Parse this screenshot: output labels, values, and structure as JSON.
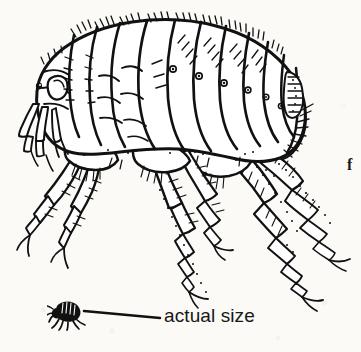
{
  "figure": {
    "caption_letter": "f",
    "background_color": "#fbfaf7",
    "ink_color": "#111111"
  },
  "scale_indicator": {
    "label": "actual size",
    "icon_name": "flea-silhouette-icon",
    "leader_line_name": "leader-line"
  },
  "anatomy": {
    "head": "head",
    "eye": "eye",
    "antenna": "antenna",
    "mouthparts": "mouthparts",
    "pronotum": "pronotum",
    "mesonotum": "mesonotum",
    "metanotum": "metanotum",
    "abdomen": "abdominal-segments",
    "sensilium": "sensilium",
    "foreleg": "foreleg",
    "midleg": "midleg",
    "hindleg": "hindleg",
    "tarsal_claw": "tarsal-claw",
    "spiracle": "spiracle"
  }
}
